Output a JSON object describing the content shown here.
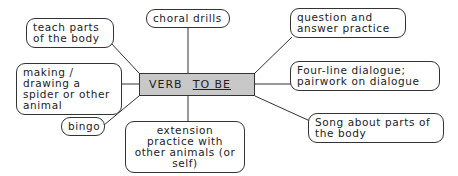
{
  "center": {
    "prefix": "VERB",
    "emphasis": "TO BE"
  },
  "nodes": [
    {
      "id": "teach",
      "text": "teach parts of the body"
    },
    {
      "id": "choral",
      "text": "choral drills"
    },
    {
      "id": "question",
      "text": "question and answer practice"
    },
    {
      "id": "making",
      "text": "making / drawing a spider or other animal"
    },
    {
      "id": "fourline",
      "text": "Four-line dialogue; pairwork on dialogue"
    },
    {
      "id": "bingo",
      "text": "bingo"
    },
    {
      "id": "extension",
      "text": "extension practice with other animals (or self)"
    },
    {
      "id": "song",
      "text": "Song about parts of the body"
    }
  ]
}
